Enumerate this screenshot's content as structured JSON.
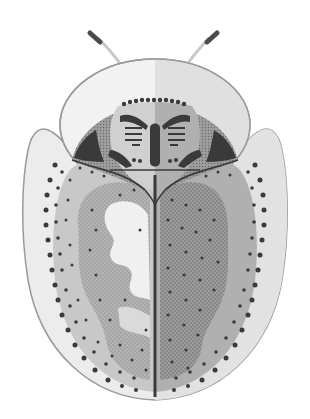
{
  "illustration": {
    "subject": "tortoise beetle (dorsal view)",
    "style": "grayscale stippled scientific illustration",
    "colors": {
      "background": "#ffffff",
      "outline": "#9a9a9a",
      "shield_light": "#ececec",
      "shield_right": "#dcdcdc",
      "pronotum_left": "#f2f2f2",
      "pronotum_right": "#e0e0e0",
      "head_left": "#c9c9c9",
      "head_right": "#a8a8a8",
      "head_side": "#8e8e8e",
      "elytra_left": "#bdbdbd",
      "elytra_right": "#a6a6a6",
      "elytra_inner_left": "#9a9a9a",
      "elytra_inner_right": "#8a8a8a",
      "highlight": "#f4f4f4",
      "dark_mark": "#3a3a3a",
      "antenna": "#c8c8c8",
      "antenna_tip": "#4a4a4a"
    }
  }
}
